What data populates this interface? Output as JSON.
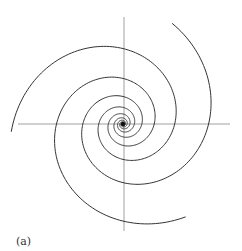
{
  "figure": {
    "caption": "(a)",
    "center": [
      123,
      124
    ],
    "axes": {
      "horizontal": {
        "x1": 18,
        "x2": 230,
        "y": 124
      },
      "vertical": {
        "x": 124,
        "y1": 17,
        "y2": 231
      },
      "color": "#888888"
    },
    "spiral": {
      "arms": 3,
      "outer_radius": 112,
      "shrink_per_quarter_turn": 0.685,
      "arm_start_angles_deg": [
        -64,
        56,
        176
      ],
      "turns": 5,
      "color": "#333333"
    }
  }
}
